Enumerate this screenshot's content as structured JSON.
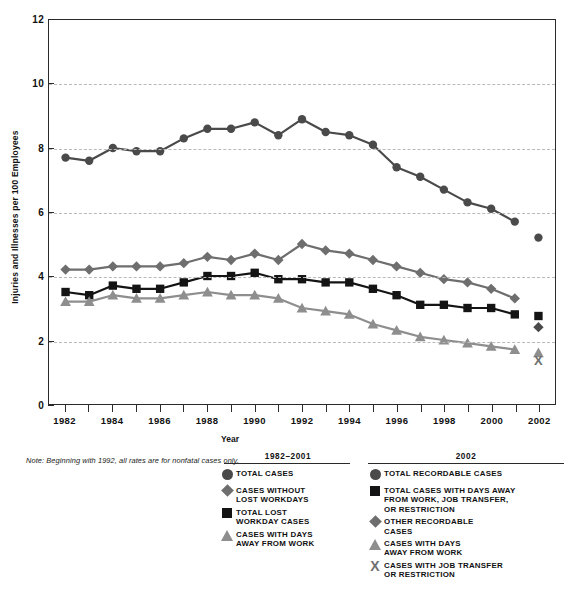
{
  "chart_data": {
    "type": "line",
    "title": "",
    "xlabel": "Year",
    "ylabel": "Injuries and Illnesses per 100 Employees",
    "ylim": [
      0,
      12
    ],
    "ytick_labels": [
      "0",
      "2",
      "4",
      "6",
      "8",
      "10",
      "12"
    ],
    "yticks": [
      0,
      2,
      4,
      6,
      8,
      10,
      12
    ],
    "grid": "horizontal-dashed",
    "xlim": [
      1981.3,
      2002.7
    ],
    "xtick_labels": [
      "1982",
      "1984",
      "1986",
      "1988",
      "1990",
      "1992",
      "1994",
      "1996",
      "1998",
      "2000",
      "2002"
    ],
    "xticks": [
      1982,
      1984,
      1986,
      1988,
      1990,
      1992,
      1994,
      1996,
      1998,
      2000,
      2002
    ],
    "x": [
      1982,
      1983,
      1984,
      1985,
      1986,
      1987,
      1988,
      1989,
      1990,
      1991,
      1992,
      1993,
      1994,
      1995,
      1996,
      1997,
      1998,
      1999,
      2000,
      2001
    ],
    "series": [
      {
        "name": "TOTAL CASES",
        "marker": "circle",
        "color": "#4a4a4a",
        "values": [
          7.7,
          7.6,
          8.0,
          7.9,
          7.9,
          8.3,
          8.6,
          8.6,
          8.8,
          8.4,
          8.9,
          8.5,
          8.4,
          8.1,
          7.4,
          7.1,
          6.7,
          6.3,
          6.1,
          5.7
        ]
      },
      {
        "name": "CASES WITHOUT LOST WORKDAYS",
        "marker": "diamond",
        "color": "#6e6e6e",
        "values": [
          4.2,
          4.2,
          4.3,
          4.3,
          4.3,
          4.4,
          4.6,
          4.5,
          4.7,
          4.5,
          5.0,
          4.8,
          4.7,
          4.5,
          4.3,
          4.1,
          3.9,
          3.8,
          3.6,
          3.3
        ]
      },
      {
        "name": "TOTAL LOST WORKDAY CASES",
        "marker": "square",
        "color": "#141414",
        "values": [
          3.5,
          3.4,
          3.7,
          3.6,
          3.6,
          3.8,
          4.0,
          4.0,
          4.1,
          3.9,
          3.9,
          3.8,
          3.8,
          3.6,
          3.4,
          3.1,
          3.1,
          3.0,
          3.0,
          2.8
        ]
      },
      {
        "name": "CASES WITH DAYS AWAY FROM WORK",
        "marker": "triangle",
        "color": "#8e8e8e",
        "values": [
          3.2,
          3.2,
          3.4,
          3.3,
          3.3,
          3.4,
          3.5,
          3.4,
          3.4,
          3.3,
          3.0,
          2.9,
          2.8,
          2.5,
          2.3,
          2.1,
          2.0,
          1.9,
          1.8,
          1.7
        ]
      }
    ],
    "detached_points_2002": [
      {
        "name": "TOTAL RECORDABLE CASES",
        "marker": "circle",
        "color": "#4a4a4a",
        "x": 2002,
        "y": 5.2
      },
      {
        "name": "TOTAL CASES WITH DAYS AWAY FROM WORK, JOB TRANSFER, OR RESTRICTION",
        "marker": "square",
        "color": "#141414",
        "x": 2002,
        "y": 2.75
      },
      {
        "name": "OTHER RECORDABLE CASES",
        "marker": "diamond",
        "color": "#4a4a4a",
        "x": 2002,
        "y": 2.4
      },
      {
        "name": "CASES WITH DAYS AWAY FROM WORK",
        "marker": "triangle",
        "color": "#8e8e8e",
        "x": 2002,
        "y": 1.6
      },
      {
        "name": "CASES WITH JOB TRANSFER OR RESTRICTION",
        "marker": "x",
        "color": "#6f6f6f",
        "x": 2002,
        "y": 1.35
      }
    ]
  },
  "note": "Note: Beginning with 1992, all rates are for nonfatal cases only.",
  "axis": {
    "y_title": "Injuries and Illnesses per 100 Employees",
    "x_title": "Year"
  },
  "legend": {
    "left": {
      "title": "1982–2001",
      "items": [
        {
          "marker": "circle",
          "label": "TOTAL CASES"
        },
        {
          "marker": "diamond",
          "label": "CASES WITHOUT\nLOST WORKDAYS"
        },
        {
          "marker": "square",
          "label": "TOTAL LOST\nWORKDAY CASES"
        },
        {
          "marker": "triangle",
          "label": "CASES WITH DAYS\nAWAY FROM WORK"
        }
      ]
    },
    "right": {
      "title": "2002",
      "items": [
        {
          "marker": "circle",
          "label": "TOTAL RECORDABLE CASES"
        },
        {
          "marker": "square",
          "label": "TOTAL CASES WITH DAYS AWAY\nFROM WORK, JOB TRANSFER,\nOR RESTRICTION"
        },
        {
          "marker": "diamond",
          "label": "OTHER RECORDABLE\nCASES"
        },
        {
          "marker": "triangle",
          "label": "CASES WITH DAYS\nAWAY FROM WORK"
        },
        {
          "marker": "x",
          "label": "CASES WITH JOB TRANSFER\nOR RESTRICTION"
        }
      ]
    }
  }
}
